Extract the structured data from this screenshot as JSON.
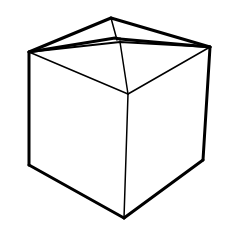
{
  "figure": {
    "stroke_color": "#000000",
    "background_color": "#ffffff"
  }
}
